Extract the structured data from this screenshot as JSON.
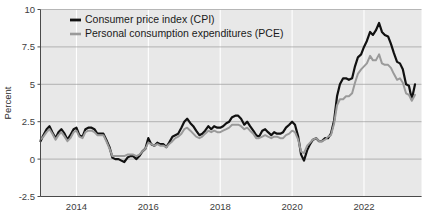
{
  "chart_data": {
    "type": "line",
    "title": "",
    "subtitle": "",
    "xlabel": "",
    "ylabel": "Percent",
    "ylim": [
      -2.5,
      10
    ],
    "xlim": [
      2013.0,
      2023.6
    ],
    "yticks": [
      -2.5,
      0,
      2.5,
      5,
      7.5,
      10
    ],
    "ytick_labels": [
      "-2.5",
      "0",
      "2.5",
      "5",
      "7.5",
      "10"
    ],
    "xticks": [
      2014,
      2016,
      2018,
      2020,
      2022
    ],
    "xtick_labels": [
      "2014",
      "2016",
      "2018",
      "2020",
      "2022"
    ],
    "grid": {
      "horizontal": true,
      "vertical": true,
      "horizontal_color": "#8d8d8d",
      "vertical_color": "#ffffff"
    },
    "plot_background": "#e8e8e8",
    "legend": {
      "position": "top-left-inside",
      "entries": [
        {
          "name": "Consumer price index (CPI)",
          "color": "#111111",
          "width": 2.2
        },
        {
          "name": "Personal consumption expenditures (PCE)",
          "color": "#9a9a9a",
          "width": 2.0
        }
      ]
    },
    "series": [
      {
        "name": "Consumer price index (CPI)",
        "color": "#111111",
        "x": [
          2013.0,
          2013.08,
          2013.17,
          2013.25,
          2013.33,
          2013.42,
          2013.5,
          2013.58,
          2013.67,
          2013.75,
          2013.83,
          2013.92,
          2014.0,
          2014.08,
          2014.17,
          2014.25,
          2014.33,
          2014.42,
          2014.5,
          2014.58,
          2014.67,
          2014.75,
          2014.83,
          2014.92,
          2015.0,
          2015.08,
          2015.17,
          2015.25,
          2015.33,
          2015.42,
          2015.5,
          2015.58,
          2015.67,
          2015.75,
          2015.83,
          2015.92,
          2016.0,
          2016.08,
          2016.17,
          2016.25,
          2016.33,
          2016.42,
          2016.5,
          2016.58,
          2016.67,
          2016.75,
          2016.83,
          2016.92,
          2017.0,
          2017.08,
          2017.17,
          2017.25,
          2017.33,
          2017.42,
          2017.5,
          2017.58,
          2017.67,
          2017.75,
          2017.83,
          2017.92,
          2018.0,
          2018.08,
          2018.17,
          2018.25,
          2018.33,
          2018.42,
          2018.5,
          2018.58,
          2018.67,
          2018.75,
          2018.83,
          2018.92,
          2019.0,
          2019.08,
          2019.17,
          2019.25,
          2019.33,
          2019.42,
          2019.5,
          2019.58,
          2019.67,
          2019.75,
          2019.83,
          2019.92,
          2020.0,
          2020.08,
          2020.17,
          2020.25,
          2020.33,
          2020.42,
          2020.5,
          2020.58,
          2020.67,
          2020.75,
          2020.83,
          2020.92,
          2021.0,
          2021.08,
          2021.17,
          2021.25,
          2021.33,
          2021.42,
          2021.5,
          2021.58,
          2021.67,
          2021.75,
          2021.83,
          2021.92,
          2022.0,
          2022.08,
          2022.17,
          2022.25,
          2022.33,
          2022.42,
          2022.5,
          2022.58,
          2022.67,
          2022.75,
          2022.83,
          2022.92,
          2023.0,
          2023.08,
          2023.17,
          2023.25,
          2023.33,
          2023.42
        ],
        "y": [
          1.2,
          1.6,
          2.0,
          2.2,
          1.8,
          1.4,
          1.8,
          2.0,
          1.7,
          1.3,
          1.6,
          2.0,
          2.1,
          1.6,
          1.5,
          2.0,
          2.1,
          2.1,
          2.0,
          1.7,
          1.7,
          1.7,
          1.3,
          0.8,
          0.1,
          0.0,
          0.0,
          -0.1,
          -0.2,
          0.1,
          0.2,
          0.2,
          0.0,
          0.2,
          0.5,
          0.7,
          1.4,
          1.0,
          0.9,
          1.1,
          1.0,
          1.0,
          0.8,
          1.1,
          1.5,
          1.6,
          1.7,
          2.1,
          2.5,
          2.7,
          2.4,
          2.2,
          1.9,
          1.6,
          1.7,
          1.9,
          2.2,
          2.0,
          2.2,
          2.1,
          2.1,
          2.2,
          2.4,
          2.5,
          2.8,
          2.9,
          2.9,
          2.7,
          2.3,
          2.5,
          2.2,
          1.9,
          1.6,
          1.5,
          1.9,
          2.0,
          1.8,
          1.6,
          1.8,
          1.7,
          1.7,
          1.8,
          2.1,
          2.3,
          2.5,
          2.3,
          1.5,
          0.3,
          -0.1,
          0.6,
          1.0,
          1.3,
          1.4,
          1.2,
          1.2,
          1.4,
          1.4,
          1.7,
          2.6,
          4.2,
          5.0,
          5.4,
          5.4,
          5.3,
          5.4,
          6.2,
          6.8,
          7.0,
          7.5,
          7.9,
          8.5,
          8.3,
          8.6,
          9.1,
          8.5,
          8.3,
          8.2,
          7.7,
          7.1,
          6.5,
          6.4,
          6.0,
          5.0,
          4.9,
          4.0,
          5.0
        ]
      },
      {
        "name": "Personal consumption expenditures (PCE)",
        "color": "#9a9a9a",
        "x": [
          2013.0,
          2013.08,
          2013.17,
          2013.25,
          2013.33,
          2013.42,
          2013.5,
          2013.58,
          2013.67,
          2013.75,
          2013.83,
          2013.92,
          2014.0,
          2014.08,
          2014.17,
          2014.25,
          2014.33,
          2014.42,
          2014.5,
          2014.58,
          2014.67,
          2014.75,
          2014.83,
          2014.92,
          2015.0,
          2015.08,
          2015.17,
          2015.25,
          2015.33,
          2015.42,
          2015.5,
          2015.58,
          2015.67,
          2015.75,
          2015.83,
          2015.92,
          2016.0,
          2016.08,
          2016.17,
          2016.25,
          2016.33,
          2016.42,
          2016.5,
          2016.58,
          2016.67,
          2016.75,
          2016.83,
          2016.92,
          2017.0,
          2017.08,
          2017.17,
          2017.25,
          2017.33,
          2017.42,
          2017.5,
          2017.58,
          2017.67,
          2017.75,
          2017.83,
          2017.92,
          2018.0,
          2018.08,
          2018.17,
          2018.25,
          2018.33,
          2018.42,
          2018.5,
          2018.58,
          2018.67,
          2018.75,
          2018.83,
          2018.92,
          2019.0,
          2019.08,
          2019.17,
          2019.25,
          2019.33,
          2019.42,
          2019.5,
          2019.58,
          2019.67,
          2019.75,
          2019.83,
          2019.92,
          2020.0,
          2020.08,
          2020.17,
          2020.25,
          2020.33,
          2020.42,
          2020.5,
          2020.58,
          2020.67,
          2020.75,
          2020.83,
          2020.92,
          2021.0,
          2021.08,
          2021.17,
          2021.25,
          2021.33,
          2021.42,
          2021.5,
          2021.58,
          2021.67,
          2021.75,
          2021.83,
          2021.92,
          2022.0,
          2022.08,
          2022.17,
          2022.25,
          2022.33,
          2022.42,
          2022.5,
          2022.58,
          2022.67,
          2022.75,
          2022.83,
          2022.92,
          2023.0,
          2023.08,
          2023.17,
          2023.25,
          2023.33,
          2023.42
        ],
        "y": [
          1.3,
          1.5,
          1.8,
          2.0,
          1.7,
          1.3,
          1.6,
          1.8,
          1.5,
          1.2,
          1.4,
          1.8,
          1.9,
          1.5,
          1.4,
          1.8,
          1.9,
          1.9,
          1.8,
          1.6,
          1.6,
          1.6,
          1.2,
          0.7,
          0.2,
          0.2,
          0.2,
          0.2,
          0.2,
          0.3,
          0.3,
          0.3,
          0.2,
          0.3,
          0.5,
          0.7,
          1.1,
          1.0,
          0.9,
          1.0,
          0.9,
          0.9,
          0.8,
          1.0,
          1.2,
          1.4,
          1.5,
          1.7,
          2.0,
          2.1,
          1.9,
          1.7,
          1.5,
          1.4,
          1.5,
          1.7,
          1.9,
          1.8,
          1.9,
          1.8,
          1.8,
          1.9,
          2.0,
          2.1,
          2.3,
          2.3,
          2.3,
          2.2,
          2.0,
          2.1,
          1.9,
          1.7,
          1.4,
          1.4,
          1.5,
          1.6,
          1.5,
          1.4,
          1.5,
          1.5,
          1.4,
          1.4,
          1.6,
          1.7,
          1.9,
          1.8,
          1.3,
          0.5,
          0.4,
          0.9,
          1.1,
          1.3,
          1.4,
          1.2,
          1.2,
          1.3,
          1.5,
          1.6,
          2.4,
          3.6,
          4.0,
          4.0,
          4.2,
          4.2,
          4.4,
          5.1,
          5.7,
          6.0,
          6.2,
          6.4,
          6.9,
          6.6,
          6.6,
          7.0,
          6.4,
          6.3,
          6.3,
          6.1,
          5.7,
          5.3,
          5.4,
          5.1,
          4.4,
          4.3,
          3.9,
          4.3
        ]
      }
    ]
  }
}
